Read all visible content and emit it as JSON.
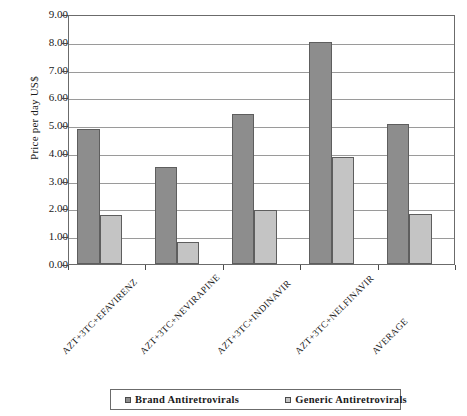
{
  "chart_data": {
    "type": "bar",
    "title": "",
    "xlabel": "",
    "ylabel": "Price per day US$",
    "ylim": [
      0,
      9
    ],
    "ytick_step": 1,
    "grid": true,
    "legend_position": "bottom",
    "categories": [
      "AZT+3TC+EFAVIRENZ",
      "AZT+3TC+NEVIRAPINE",
      "AZT+3TC+INDINAVIR",
      "AZT+3TC+NELFINAVIR",
      "AVERAGE"
    ],
    "series": [
      {
        "name": "Brand Antiretrovirals",
        "color": "#8d8d8d",
        "values": [
          4.85,
          3.5,
          5.4,
          8.0,
          5.05
        ]
      },
      {
        "name": "Generic Antiretrovirals",
        "color": "#c4c4c4",
        "values": [
          1.75,
          0.78,
          1.95,
          3.85,
          1.8
        ]
      }
    ],
    "ytick_labels": [
      "9.00",
      "8.00",
      "7.00",
      "6.00",
      "5.00",
      "4.00",
      "3.00",
      "2.00",
      "1.00",
      "0.00"
    ]
  },
  "axis": {
    "y_title": "Price per day US$"
  },
  "legend": {
    "entries": [
      {
        "label": "Brand Antiretrovirals",
        "swatch": "brand"
      },
      {
        "label": "Generic Antiretrovirals",
        "swatch": "generic"
      }
    ]
  }
}
